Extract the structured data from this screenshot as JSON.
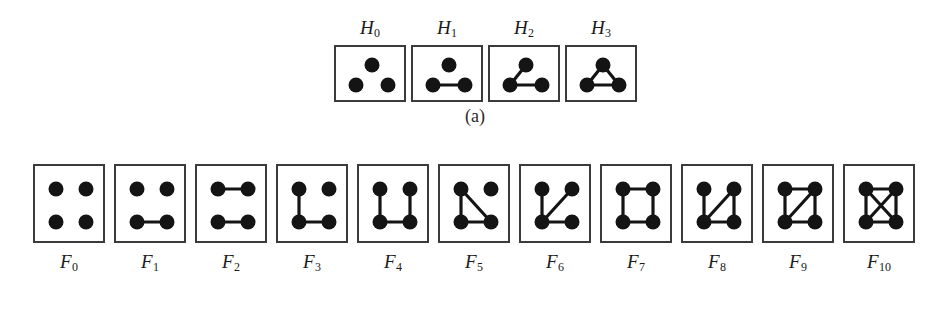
{
  "figure": {
    "caption_a": "(a)",
    "caption_b": "(b)",
    "vertex_color": "#141414",
    "edge_color": "#141414",
    "box_border_color": "#3b3b3b",
    "background_color": "#ffffff"
  },
  "panel_a": {
    "id": "a",
    "label_position": "top",
    "graphs": [
      {
        "name": "H0",
        "label_base": "H",
        "label_sub": "0",
        "vertex_count": 3,
        "edge_count": 0,
        "vertices": [
          {
            "id": "t",
            "x": 36,
            "y": 18
          },
          {
            "id": "bl",
            "x": 20,
            "y": 38
          },
          {
            "id": "br",
            "x": 52,
            "y": 38
          }
        ],
        "edges": [],
        "description": "three isolated vertices"
      },
      {
        "name": "H1",
        "label_base": "H",
        "label_sub": "1",
        "vertex_count": 3,
        "edge_count": 1,
        "vertices": [
          {
            "id": "t",
            "x": 36,
            "y": 18
          },
          {
            "id": "bl",
            "x": 20,
            "y": 38
          },
          {
            "id": "br",
            "x": 52,
            "y": 38
          }
        ],
        "edges": [
          [
            "bl",
            "br"
          ]
        ],
        "description": "single edge plus isolated vertex"
      },
      {
        "name": "H2",
        "label_base": "H",
        "label_sub": "2",
        "vertex_count": 3,
        "edge_count": 2,
        "vertices": [
          {
            "id": "t",
            "x": 36,
            "y": 18
          },
          {
            "id": "bl",
            "x": 20,
            "y": 38
          },
          {
            "id": "br",
            "x": 52,
            "y": 38
          }
        ],
        "edges": [
          [
            "bl",
            "t"
          ],
          [
            "bl",
            "br"
          ]
        ],
        "description": "path on three vertices"
      },
      {
        "name": "H3",
        "label_base": "H",
        "label_sub": "3",
        "vertex_count": 3,
        "edge_count": 3,
        "vertices": [
          {
            "id": "t",
            "x": 36,
            "y": 18
          },
          {
            "id": "bl",
            "x": 20,
            "y": 38
          },
          {
            "id": "br",
            "x": 52,
            "y": 38
          }
        ],
        "edges": [
          [
            "bl",
            "t"
          ],
          [
            "t",
            "br"
          ],
          [
            "bl",
            "br"
          ]
        ],
        "description": "triangle"
      }
    ]
  },
  "panel_b": {
    "id": "b",
    "label_position": "bottom",
    "graphs": [
      {
        "name": "F0",
        "label_base": "F",
        "label_sub": "0",
        "vertex_count": 4,
        "edge_count": 0,
        "vertices": [
          {
            "id": "tl",
            "x": 21,
            "y": 23
          },
          {
            "id": "tr",
            "x": 51,
            "y": 23
          },
          {
            "id": "bl",
            "x": 21,
            "y": 56
          },
          {
            "id": "br",
            "x": 51,
            "y": 56
          }
        ],
        "edges": [],
        "description": "four isolated vertices"
      },
      {
        "name": "F1",
        "label_base": "F",
        "label_sub": "1",
        "vertex_count": 4,
        "edge_count": 1,
        "vertices": [
          {
            "id": "tl",
            "x": 21,
            "y": 23
          },
          {
            "id": "tr",
            "x": 51,
            "y": 23
          },
          {
            "id": "bl",
            "x": 21,
            "y": 56
          },
          {
            "id": "br",
            "x": 51,
            "y": 56
          }
        ],
        "edges": [
          [
            "bl",
            "br"
          ]
        ],
        "description": "one edge"
      },
      {
        "name": "F2",
        "label_base": "F",
        "label_sub": "2",
        "vertex_count": 4,
        "edge_count": 2,
        "vertices": [
          {
            "id": "tl",
            "x": 21,
            "y": 23
          },
          {
            "id": "tr",
            "x": 51,
            "y": 23
          },
          {
            "id": "bl",
            "x": 21,
            "y": 56
          },
          {
            "id": "br",
            "x": 51,
            "y": 56
          }
        ],
        "edges": [
          [
            "tl",
            "tr"
          ],
          [
            "bl",
            "br"
          ]
        ],
        "description": "perfect matching, two disjoint edges"
      },
      {
        "name": "F3",
        "label_base": "F",
        "label_sub": "3",
        "vertex_count": 4,
        "edge_count": 2,
        "vertices": [
          {
            "id": "tl",
            "x": 21,
            "y": 23
          },
          {
            "id": "tr",
            "x": 51,
            "y": 23
          },
          {
            "id": "bl",
            "x": 21,
            "y": 56
          },
          {
            "id": "br",
            "x": 51,
            "y": 56
          }
        ],
        "edges": [
          [
            "tl",
            "bl"
          ],
          [
            "bl",
            "br"
          ]
        ],
        "description": "path on three vertices plus isolated vertex"
      },
      {
        "name": "F4",
        "label_base": "F",
        "label_sub": "4",
        "vertex_count": 4,
        "edge_count": 3,
        "vertices": [
          {
            "id": "tl",
            "x": 21,
            "y": 23
          },
          {
            "id": "tr",
            "x": 51,
            "y": 23
          },
          {
            "id": "bl",
            "x": 21,
            "y": 56
          },
          {
            "id": "br",
            "x": 51,
            "y": 56
          }
        ],
        "edges": [
          [
            "tl",
            "bl"
          ],
          [
            "bl",
            "br"
          ],
          [
            "br",
            "tr"
          ]
        ],
        "description": "path on four vertices"
      },
      {
        "name": "F5",
        "label_base": "F",
        "label_sub": "5",
        "vertex_count": 4,
        "edge_count": 3,
        "vertices": [
          {
            "id": "tl",
            "x": 21,
            "y": 23
          },
          {
            "id": "tr",
            "x": 51,
            "y": 23
          },
          {
            "id": "bl",
            "x": 21,
            "y": 56
          },
          {
            "id": "br",
            "x": 51,
            "y": 56
          }
        ],
        "edges": [
          [
            "tl",
            "bl"
          ],
          [
            "bl",
            "br"
          ],
          [
            "tl",
            "br"
          ]
        ],
        "description": "triangle plus isolated vertex"
      },
      {
        "name": "F6",
        "label_base": "F",
        "label_sub": "6",
        "vertex_count": 4,
        "edge_count": 3,
        "vertices": [
          {
            "id": "tl",
            "x": 21,
            "y": 23
          },
          {
            "id": "tr",
            "x": 51,
            "y": 23
          },
          {
            "id": "bl",
            "x": 21,
            "y": 56
          },
          {
            "id": "br",
            "x": 51,
            "y": 56
          }
        ],
        "edges": [
          [
            "tl",
            "bl"
          ],
          [
            "bl",
            "tr"
          ],
          [
            "bl",
            "br"
          ]
        ],
        "description": "star K1,3 centred at bottom-left"
      },
      {
        "name": "F7",
        "label_base": "F",
        "label_sub": "7",
        "vertex_count": 4,
        "edge_count": 4,
        "vertices": [
          {
            "id": "tl",
            "x": 21,
            "y": 23
          },
          {
            "id": "tr",
            "x": 51,
            "y": 23
          },
          {
            "id": "bl",
            "x": 21,
            "y": 56
          },
          {
            "id": "br",
            "x": 51,
            "y": 56
          }
        ],
        "edges": [
          [
            "tl",
            "tr"
          ],
          [
            "tl",
            "bl"
          ],
          [
            "bl",
            "br"
          ],
          [
            "tr",
            "br"
          ]
        ],
        "description": "four-cycle"
      },
      {
        "name": "F8",
        "label_base": "F",
        "label_sub": "8",
        "vertex_count": 4,
        "edge_count": 4,
        "vertices": [
          {
            "id": "tl",
            "x": 21,
            "y": 23
          },
          {
            "id": "tr",
            "x": 51,
            "y": 23
          },
          {
            "id": "bl",
            "x": 21,
            "y": 56
          },
          {
            "id": "br",
            "x": 51,
            "y": 56
          }
        ],
        "edges": [
          [
            "tl",
            "bl"
          ],
          [
            "bl",
            "tr"
          ],
          [
            "bl",
            "br"
          ],
          [
            "tr",
            "br"
          ]
        ],
        "description": "triangle with a pendant edge (paw)"
      },
      {
        "name": "F9",
        "label_base": "F",
        "label_sub": "9",
        "vertex_count": 4,
        "edge_count": 5,
        "vertices": [
          {
            "id": "tl",
            "x": 21,
            "y": 23
          },
          {
            "id": "tr",
            "x": 51,
            "y": 23
          },
          {
            "id": "bl",
            "x": 21,
            "y": 56
          },
          {
            "id": "br",
            "x": 51,
            "y": 56
          }
        ],
        "edges": [
          [
            "tl",
            "tr"
          ],
          [
            "tl",
            "bl"
          ],
          [
            "bl",
            "tr"
          ],
          [
            "bl",
            "br"
          ],
          [
            "tr",
            "br"
          ]
        ],
        "description": "four-cycle with one diagonal (diamond)"
      },
      {
        "name": "F10",
        "label_base": "F",
        "label_sub": "10",
        "vertex_count": 4,
        "edge_count": 6,
        "vertices": [
          {
            "id": "tl",
            "x": 21,
            "y": 23
          },
          {
            "id": "tr",
            "x": 51,
            "y": 23
          },
          {
            "id": "bl",
            "x": 21,
            "y": 56
          },
          {
            "id": "br",
            "x": 51,
            "y": 56
          }
        ],
        "edges": [
          [
            "tl",
            "tr"
          ],
          [
            "tl",
            "bl"
          ],
          [
            "bl",
            "br"
          ],
          [
            "tr",
            "br"
          ],
          [
            "tl",
            "br"
          ],
          [
            "bl",
            "tr"
          ]
        ],
        "description": "complete graph K4"
      }
    ]
  }
}
